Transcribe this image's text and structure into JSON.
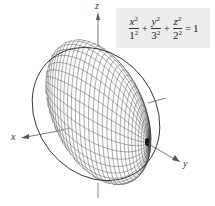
{
  "equation": {
    "terms": [
      {
        "var": "x",
        "exp": "2",
        "den_base": "1",
        "den_exp": "2"
      },
      {
        "var": "y",
        "exp": "2",
        "den_base": "3",
        "den_exp": "2"
      },
      {
        "var": "z",
        "exp": "2",
        "den_base": "2",
        "den_exp": "2"
      }
    ],
    "plus": "+",
    "equals": "=",
    "rhs": "1",
    "background": "#ececec"
  },
  "axes": {
    "x_label": "x",
    "y_label": "y",
    "z_label": "z",
    "color": "#555555"
  },
  "surface": {
    "type": "ellipsoid",
    "semi_axes": {
      "a": 1,
      "b": 3,
      "c": 2
    },
    "mesh_color": "#444444",
    "meridians": 36,
    "parallels": 18
  }
}
